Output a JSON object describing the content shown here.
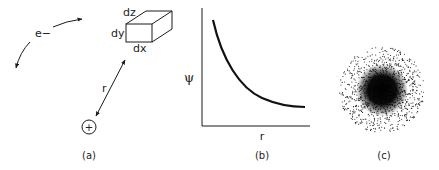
{
  "panels": {
    "a": {
      "caption": "(a)",
      "electron_label": "e−",
      "distance_label": "r",
      "nucleus_symbol": "+",
      "volume_element": {
        "dx": "dx",
        "dy": "dy",
        "dz": "dz"
      }
    },
    "b": {
      "caption": "(b)",
      "ylabel": "ψ",
      "xlabel": "r"
    },
    "c": {
      "caption": "(c)"
    }
  },
  "chart_data": {
    "type": "line",
    "title": "",
    "xlabel": "r",
    "ylabel": "ψ",
    "grid": false,
    "series": [
      {
        "name": "ψ(r)",
        "description": "monotonically decreasing exponential-like decay",
        "x": [
          0.1,
          0.2,
          0.3,
          0.4,
          0.5,
          0.6,
          0.7,
          0.8,
          0.9,
          1.0
        ],
        "values": [
          1.0,
          0.74,
          0.55,
          0.42,
          0.32,
          0.25,
          0.2,
          0.17,
          0.15,
          0.14
        ]
      }
    ],
    "ticks": "none"
  },
  "colors": {
    "ink": "#1a1a1a",
    "background": "#ffffff"
  }
}
